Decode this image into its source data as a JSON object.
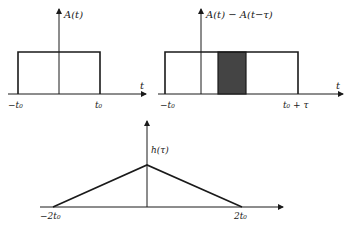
{
  "colors": {
    "ink": "#1a1a1a",
    "shade": "#444444",
    "background": "#ffffff"
  },
  "panels": {
    "top_left": {
      "y_label": "A(t)",
      "x_label": "t",
      "ticks": [
        "−t₀",
        "t₀"
      ],
      "shape": "rectangle pulse from −t₀ to t₀"
    },
    "top_right": {
      "y_label": "A(t) − A(t−τ)",
      "x_label": "t",
      "ticks": [
        "−t₀",
        "t₀ + τ"
      ],
      "shape": "rectangle pulse from −t₀ to t₀+τ with shaded overlap band"
    },
    "bottom": {
      "y_label": "h(τ)",
      "ticks": [
        "−2t₀",
        "2t₀"
      ],
      "shape": "triangle from −2t₀ to 2t₀ peaking at τ=0"
    }
  }
}
